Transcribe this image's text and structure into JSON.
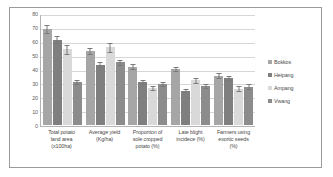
{
  "chart_data": {
    "type": "bar",
    "title": "",
    "xlabel": "",
    "ylabel": "",
    "ylim": [
      0,
      80
    ],
    "yticks": [
      80,
      70,
      60,
      50,
      40,
      30,
      20,
      10,
      0
    ],
    "grid": true,
    "legend_position": "right",
    "categories": [
      "Total potato land area (x100ha)",
      "Average yield (Kg/ha)",
      "Proportion of sole cropped potato (%)",
      "Late blight incidece (%)",
      "Farmers using exortic seeds (%)"
    ],
    "category_lines": [
      [
        "Total potato",
        "land area",
        "(x100ha)"
      ],
      [
        "Average yield",
        "(Kg/ha)"
      ],
      [
        "Proportion of",
        "sole cropped",
        "potato (%)"
      ],
      [
        "Late blight",
        "incidece (%)"
      ],
      [
        "Farmers using",
        "exortic seeds",
        "(%)"
      ]
    ],
    "series": [
      {
        "name": "Bokkos",
        "color": "#a6a6a6",
        "values": [
          70,
          54,
          42.5,
          41,
          36
        ],
        "errors": [
          3,
          2,
          2,
          1.5,
          1.5
        ]
      },
      {
        "name": "Heipang",
        "color": "#7f7f7f",
        "values": [
          62,
          44,
          31,
          25,
          34
        ],
        "errors": [
          2.5,
          1.5,
          1.5,
          1,
          1.5
        ]
      },
      {
        "name": "Ampang",
        "color": "#d9d9d9",
        "values": [
          55,
          56.5,
          27,
          32.5,
          26.5
        ],
        "errors": [
          3,
          3,
          1.5,
          2,
          1.5
        ]
      },
      {
        "name": "Vwang",
        "color": "#8c8c8c",
        "values": [
          31.5,
          45.5,
          30,
          28.5,
          28
        ],
        "errors": [
          1.5,
          2,
          1.5,
          1.5,
          1.5
        ]
      }
    ]
  }
}
